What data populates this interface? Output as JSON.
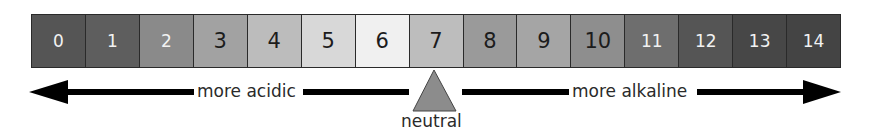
{
  "scale": {
    "cells": [
      {
        "value": "0",
        "color": "#555555",
        "text_color": "light"
      },
      {
        "value": "1",
        "color": "#5e5e5e",
        "text_color": "light"
      },
      {
        "value": "2",
        "color": "#8a8a8a",
        "text_color": "light"
      },
      {
        "value": "3",
        "color": "#a2a2a2",
        "text_color": "dark"
      },
      {
        "value": "4",
        "color": "#bcbcbc",
        "text_color": "dark"
      },
      {
        "value": "5",
        "color": "#d8d8d8",
        "text_color": "dark"
      },
      {
        "value": "6",
        "color": "#f0f0f0",
        "text_color": "dark"
      },
      {
        "value": "7",
        "color": "#bdbdbd",
        "text_color": "dark"
      },
      {
        "value": "8",
        "color": "#9a9a9a",
        "text_color": "dark"
      },
      {
        "value": "9",
        "color": "#a5a5a5",
        "text_color": "dark"
      },
      {
        "value": "10",
        "color": "#8e8e8e",
        "text_color": "dark"
      },
      {
        "value": "11",
        "color": "#6e6e6e",
        "text_color": "light"
      },
      {
        "value": "12",
        "color": "#555555",
        "text_color": "light"
      },
      {
        "value": "13",
        "color": "#474747",
        "text_color": "light"
      },
      {
        "value": "14",
        "color": "#444444",
        "text_color": "light"
      }
    ]
  },
  "labels": {
    "acidic": "more acidic",
    "alkaline": "more alkaline",
    "neutral": "neutral"
  },
  "colors": {
    "arrow": "#000000",
    "fulcrum": "#8c8c8c",
    "border": "#2a2a2a"
  }
}
